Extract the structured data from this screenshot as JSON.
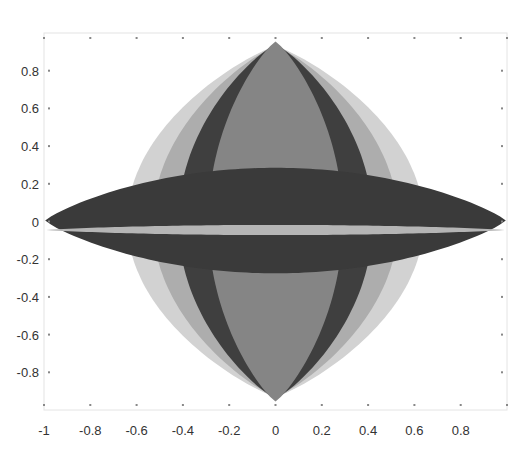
{
  "chart_data": {
    "type": "area",
    "title": "",
    "xlabel": "",
    "ylabel": "",
    "xlim": [
      -1,
      1
    ],
    "ylim": [
      -1,
      1
    ],
    "grid": false,
    "legend": null,
    "x_ticks": [
      -1,
      -0.8,
      -0.6,
      -0.4,
      -0.2,
      0,
      0.2,
      0.4,
      0.6,
      0.8
    ],
    "x_tick_labels": [
      "-1",
      "-0.8",
      "-0.6",
      "-0.4",
      "-0.2",
      "0",
      "0.2",
      "0.4",
      "0.6",
      "0.8"
    ],
    "y_ticks": [
      0.8,
      0.6,
      0.4,
      0.2,
      0,
      -0.2,
      -0.4,
      -0.6,
      -0.8
    ],
    "y_tick_labels": [
      "0.8",
      "0.6",
      "0.4",
      "0.2",
      "0",
      "-0.2",
      "-0.4",
      "-0.6",
      "-0.8"
    ],
    "series": [
      {
        "name": "vertical-lens-outer",
        "shape": "lens",
        "orientation": "vertical",
        "cx": 0,
        "cy": 0,
        "half_width": 0.64,
        "half_height": 0.93,
        "color": "#d2d2d2"
      },
      {
        "name": "vertical-lens-second",
        "shape": "lens",
        "orientation": "vertical",
        "cx": 0,
        "cy": 0,
        "half_width": 0.53,
        "half_height": 0.93,
        "color": "#adadad"
      },
      {
        "name": "vertical-lens-dark",
        "shape": "lens",
        "orientation": "vertical",
        "cx": 0,
        "cy": 0,
        "half_width": 0.42,
        "half_height": 0.94,
        "color": "#3f3f3f"
      },
      {
        "name": "vertical-lens-center",
        "shape": "lens",
        "orientation": "vertical",
        "cx": 0,
        "cy": 0,
        "half_width": 0.29,
        "half_height": 0.955,
        "color": "#858585"
      },
      {
        "name": "horizontal-lens-dark",
        "shape": "lens",
        "orientation": "horizontal",
        "cx": 0,
        "cy": 0.005,
        "half_width": 0.995,
        "half_height": 0.28,
        "color": "#3a3a3a"
      },
      {
        "name": "horizontal-lens-thin",
        "shape": "lens",
        "orientation": "horizontal",
        "cx": 0,
        "cy": -0.045,
        "half_width": 0.99,
        "half_height": 0.027,
        "color": "#b5b5b5"
      }
    ]
  },
  "plot_area": {
    "left": 44,
    "top": 33,
    "right": 507,
    "bottom": 410
  }
}
